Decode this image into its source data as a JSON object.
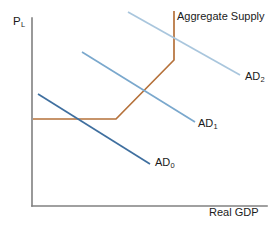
{
  "chart_data": {
    "type": "line",
    "title": "",
    "subtitle": "",
    "xlabel": "Real GDP",
    "ylabel": "P",
    "ylabel_subscript": "L",
    "grid": false,
    "legend_position": "inline-end-of-curve",
    "axes": {
      "x_axis_label": "Real GDP",
      "y_axis_label": "P_L",
      "x_tick_labels": [],
      "y_tick_labels": [],
      "xlim": [
        0,
        100
      ],
      "ylim": [
        0,
        100
      ],
      "origin_px": [
        32,
        206
      ],
      "x_axis_end_px": [
        267,
        206
      ],
      "y_axis_top_px": [
        32,
        18
      ]
    },
    "series": [
      {
        "name": "Aggregate Supply",
        "label": "Aggregate Supply",
        "color": "#b5713a",
        "stroke_width": 1.7,
        "shape": "keynesian-three-range",
        "points_px": [
          [
            33,
            119
          ],
          [
            116,
            119
          ],
          [
            174,
            60
          ],
          [
            174,
            11
          ]
        ],
        "description": "Horizontal (Keynesian) range, upward-sloping (intermediate) range, vertical (classical) range"
      },
      {
        "name": "AD0",
        "label": "AD",
        "label_subscript": "0",
        "color": "#3f6f9f",
        "stroke_width": 1.7,
        "shape": "line",
        "points_px": [
          [
            38,
            94
          ],
          [
            150,
            164
          ]
        ]
      },
      {
        "name": "AD1",
        "label": "AD",
        "label_subscript": "1",
        "color": "#7aa8cd",
        "stroke_width": 1.7,
        "shape": "line",
        "points_px": [
          [
            82,
            52
          ],
          [
            195,
            122
          ]
        ]
      },
      {
        "name": "AD2",
        "label": "AD",
        "label_subscript": "2",
        "color": "#a9c6dd",
        "stroke_width": 1.7,
        "shape": "line",
        "points_px": [
          [
            128,
            12
          ],
          [
            240,
            75
          ]
        ]
      }
    ],
    "annotations": [
      {
        "name": "aggregate-supply-label",
        "text": "Aggregate Supply",
        "x_px": 177,
        "y_px": 11
      },
      {
        "name": "ad0-label",
        "text": "AD",
        "subscript": "0",
        "x_px": 155,
        "y_px": 157
      },
      {
        "name": "ad1-label",
        "text": "AD",
        "subscript": "1",
        "x_px": 198,
        "y_px": 118
      },
      {
        "name": "ad2-label",
        "text": "AD",
        "subscript": "2",
        "x_px": 245,
        "y_px": 71
      }
    ],
    "colors": {
      "axis": "#808080",
      "aggregate_supply": "#b5713a",
      "ad0": "#3f6f9f",
      "ad1": "#7aa8cd",
      "ad2": "#a9c6dd",
      "background": "#ffffff",
      "text": "#1a1a1a"
    }
  },
  "labels": {
    "y_axis_main": "P",
    "y_axis_sub": "L",
    "x_axis": "Real GDP",
    "aggregate_supply": "Aggregate Supply",
    "ad_base": "AD",
    "ad0_sub": "0",
    "ad1_sub": "1",
    "ad2_sub": "2"
  }
}
